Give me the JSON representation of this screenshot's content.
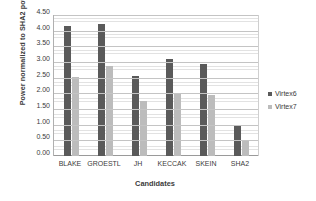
{
  "chart_data": {
    "type": "bar",
    "title": "",
    "xlabel": "Candidates",
    "ylabel": "Power normalized to SHA2 power",
    "categories": [
      "BLAKE",
      "GROESTL",
      "JH",
      "KECCAK",
      "SKEIN",
      "SHA2"
    ],
    "series": [
      {
        "name": "Virtex6",
        "color": "#5a5a5a",
        "values": [
          4.15,
          4.2,
          2.55,
          3.1,
          2.93,
          1.0
        ]
      },
      {
        "name": "Virtex7",
        "color": "#bcbcbc",
        "values": [
          2.52,
          2.87,
          1.75,
          2.0,
          1.95,
          0.5
        ]
      }
    ],
    "ylim": [
      0.0,
      4.5
    ],
    "ytick_labels": [
      "0.00",
      "0.50",
      "1.00",
      "1.50",
      "2.00",
      "2.50",
      "3.00",
      "3.50",
      "4.00",
      "4.50"
    ],
    "ytick_values": [
      0.0,
      0.5,
      1.0,
      1.5,
      2.0,
      2.5,
      3.0,
      3.5,
      4.0,
      4.5
    ],
    "grid": true,
    "legend_position": "right"
  }
}
